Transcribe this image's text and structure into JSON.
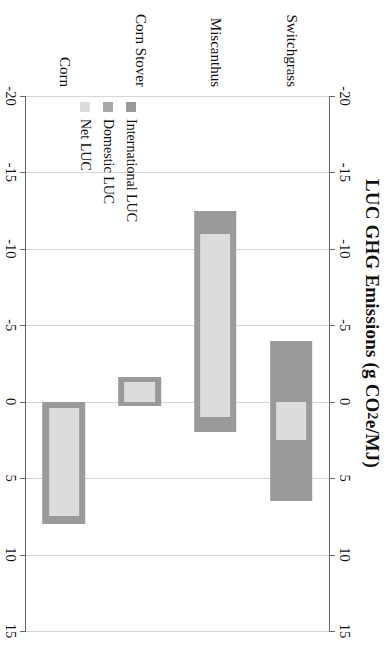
{
  "chart_data": {
    "type": "bar",
    "orientation": "horizontal-rotated",
    "title": "LUC GHG Emissions (g CO",
    "title_sub": "2",
    "title_tail": "e/MJ)",
    "title_full": "LUC GHG Emissions (g CO2e/MJ)",
    "xlabel": "LUC GHG Emissions (g CO2e/MJ)",
    "ylabel": "",
    "xlim": [
      -20,
      15
    ],
    "ticks": [
      -20,
      -15,
      -10,
      -5,
      0,
      5,
      10,
      15
    ],
    "tick_labels": [
      "-20",
      "-15",
      "-10",
      "-5",
      "0",
      "5",
      "10",
      "15"
    ],
    "grid": true,
    "axis_duplicated": true,
    "legend_position": "inner-left-lower",
    "categories": [
      "Switchgrass",
      "Miscanthus",
      "Corn Stover",
      "Corn"
    ],
    "series": [
      {
        "name": "International LUC",
        "color": "#9a9a9a",
        "ranges": [
          {
            "category": "Switchgrass",
            "low": -4.0,
            "high": 6.5
          },
          {
            "category": "Miscanthus",
            "low": -12.5,
            "high": 2.0
          },
          {
            "category": "Corn Stover",
            "low": -1.6,
            "high": 0.3
          },
          {
            "category": "Corn",
            "low": 0.0,
            "high": 8.0
          }
        ]
      },
      {
        "name": "Domestic LUC",
        "color": "#a8a8a8",
        "ranges": [
          {
            "category": "Switchgrass",
            "low": -4.0,
            "high": 6.5
          },
          {
            "category": "Miscanthus",
            "low": -12.5,
            "high": 2.0
          },
          {
            "category": "Corn Stover",
            "low": -1.6,
            "high": 0.3
          },
          {
            "category": "Corn",
            "low": 0.0,
            "high": 8.0
          }
        ]
      },
      {
        "name": "Net LUC",
        "color": "#dcdcdc",
        "ranges": [
          {
            "category": "Switchgrass",
            "low": 0.0,
            "high": 2.5
          },
          {
            "category": "Miscanthus",
            "low": -11.0,
            "high": 1.0
          },
          {
            "category": "Corn Stover",
            "low": -1.3,
            "high": 0.0
          },
          {
            "category": "Corn",
            "low": 0.4,
            "high": 7.5
          }
        ]
      }
    ],
    "bars": [
      {
        "category": "Switchgrass",
        "outer_low": -4.0,
        "outer_high": 6.5,
        "inner_low": 0.0,
        "inner_high": 2.5
      },
      {
        "category": "Miscanthus",
        "outer_low": -12.5,
        "outer_high": 2.0,
        "inner_low": -11.0,
        "inner_high": 1.0
      },
      {
        "category": "Corn Stover",
        "outer_low": -1.6,
        "outer_high": 0.3,
        "inner_low": -1.3,
        "inner_high": 0.0
      },
      {
        "category": "Corn",
        "outer_low": 0.0,
        "outer_high": 8.0,
        "inner_low": 0.4,
        "inner_high": 7.5
      }
    ],
    "legend": [
      {
        "label": "International LUC",
        "color": "#9a9a9a"
      },
      {
        "label": "Domestic LUC",
        "color": "#a8a8a8"
      },
      {
        "label": "Net LUC",
        "color": "#dcdcdc"
      }
    ]
  },
  "colors": {
    "international": "#9a9a9a",
    "domestic": "#a8a8a8",
    "net": "#dcdcdc",
    "grid": "#d6d6d6",
    "axis": "#666666",
    "text": "#111111"
  }
}
